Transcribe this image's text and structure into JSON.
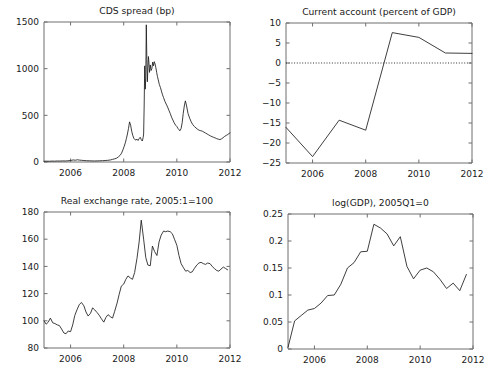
{
  "figure": {
    "name": "four-panel-macro-figure",
    "background": "#ffffff",
    "line_color": "#1c1c1c",
    "axis_color": "#6f6f6f",
    "panel_count": 4
  },
  "chart_data": [
    {
      "id": "cds",
      "type": "line",
      "title": "CDS spread (bp)",
      "xlabel": "",
      "ylabel": "",
      "grid": false,
      "legend": "none",
      "xlim": [
        2005.0,
        2012.0
      ],
      "ylim": [
        0,
        1500
      ],
      "xticks": [
        2006,
        2008,
        2010,
        2012
      ],
      "xticklabels": [
        "2006",
        "2008",
        "2010",
        "2012"
      ],
      "yticks": [
        0,
        500,
        1000,
        1500
      ],
      "yticklabels": [
        "0",
        "500",
        "1000",
        "1500"
      ],
      "series": [
        {
          "name": "CDS spread",
          "x": [
            2005.0,
            2005.1,
            2005.2,
            2005.3,
            2005.4,
            2005.5,
            2005.6,
            2005.7,
            2005.8,
            2005.9,
            2006.0,
            2006.1,
            2006.18,
            2006.26,
            2006.34,
            2006.42,
            2006.5,
            2006.6,
            2006.7,
            2006.8,
            2006.9,
            2007.0,
            2007.1,
            2007.2,
            2007.3,
            2007.4,
            2007.5,
            2007.58,
            2007.66,
            2007.74,
            2007.8,
            2007.86,
            2007.92,
            2007.97,
            2008.02,
            2008.06,
            2008.1,
            2008.14,
            2008.18,
            2008.22,
            2008.26,
            2008.3,
            2008.34,
            2008.38,
            2008.42,
            2008.46,
            2008.5,
            2008.54,
            2008.58,
            2008.62,
            2008.66,
            2008.7,
            2008.73,
            2008.75,
            2008.77,
            2008.79,
            2008.81,
            2008.83,
            2008.85,
            2008.87,
            2008.89,
            2008.91,
            2008.93,
            2008.95,
            2008.97,
            2009.0,
            2009.03,
            2009.06,
            2009.09,
            2009.12,
            2009.15,
            2009.18,
            2009.21,
            2009.24,
            2009.27,
            2009.3,
            2009.34,
            2009.38,
            2009.42,
            2009.46,
            2009.5,
            2009.55,
            2009.6,
            2009.65,
            2009.7,
            2009.75,
            2009.8,
            2009.85,
            2009.9,
            2009.95,
            2010.0,
            2010.04,
            2010.08,
            2010.12,
            2010.16,
            2010.2,
            2010.24,
            2010.28,
            2010.32,
            2010.36,
            2010.42,
            2010.48,
            2010.54,
            2010.6,
            2010.66,
            2010.72,
            2010.78,
            2010.84,
            2010.9,
            2010.96,
            2011.02,
            2011.08,
            2011.14,
            2011.2,
            2011.26,
            2011.32,
            2011.38,
            2011.44,
            2011.5,
            2011.56,
            2011.62,
            2011.68,
            2011.74,
            2011.8,
            2011.86,
            2011.92,
            2011.96,
            2012.0
          ],
          "y": [
            8,
            9,
            8,
            10,
            9,
            11,
            10,
            12,
            11,
            13,
            16,
            22,
            19,
            24,
            20,
            18,
            16,
            14,
            13,
            12,
            11,
            12,
            13,
            14,
            16,
            18,
            22,
            28,
            34,
            42,
            55,
            70,
            95,
            130,
            170,
            205,
            250,
            300,
            360,
            430,
            395,
            330,
            285,
            255,
            240,
            235,
            245,
            230,
            250,
            265,
            240,
            225,
            260,
            300,
            600,
            1030,
            780,
            900,
            1470,
            1100,
            860,
            1010,
            1130,
            1060,
            960,
            1040,
            980,
            1000,
            1070,
            1030,
            1075,
            1050,
            1010,
            960,
            915,
            880,
            830,
            800,
            760,
            720,
            690,
            650,
            620,
            590,
            555,
            520,
            480,
            450,
            420,
            395,
            380,
            360,
            345,
            335,
            360,
            420,
            520,
            600,
            655,
            610,
            520,
            470,
            430,
            400,
            380,
            365,
            350,
            340,
            335,
            330,
            320,
            310,
            300,
            290,
            280,
            272,
            265,
            258,
            250,
            245,
            240,
            248,
            260,
            275,
            285,
            295,
            305,
            312
          ]
        }
      ]
    },
    {
      "id": "current-account",
      "type": "line",
      "title": "Current account (percent of GDP)",
      "xlabel": "",
      "ylabel": "",
      "grid": false,
      "legend": "none",
      "xlim": [
        2005.0,
        2012.0
      ],
      "ylim": [
        -25,
        10
      ],
      "xticks": [
        2006,
        2008,
        2010,
        2012
      ],
      "xticklabels": [
        "2006",
        "2008",
        "2010",
        "2012"
      ],
      "yticks": [
        -25,
        -20,
        -15,
        -10,
        -5,
        0,
        5,
        10
      ],
      "yticklabels": [
        "−25",
        "−20",
        "−15",
        "−10",
        "−5",
        "0",
        "5",
        "10"
      ],
      "zero_line": {
        "value": 0,
        "style": "dotted"
      },
      "series": [
        {
          "name": "Current account",
          "x": [
            2005,
            2006,
            2007,
            2008,
            2009,
            2010,
            2011,
            2012
          ],
          "y": [
            -16.1,
            -23.4,
            -14.3,
            -16.8,
            7.6,
            6.4,
            2.5,
            2.4
          ]
        }
      ]
    },
    {
      "id": "real-exchange-rate",
      "type": "line",
      "title": "Real exchange rate, 2005:1=100",
      "xlabel": "",
      "ylabel": "",
      "grid": false,
      "legend": "none",
      "xlim": [
        2005.0,
        2012.0
      ],
      "ylim": [
        80,
        180
      ],
      "xticks": [
        2006,
        2008,
        2010,
        2012
      ],
      "xticklabels": [
        "2006",
        "2008",
        "2010",
        "2012"
      ],
      "yticks": [
        80,
        100,
        120,
        140,
        160,
        180
      ],
      "yticklabels": [
        "80",
        "100",
        "120",
        "140",
        "160",
        "180"
      ],
      "series": [
        {
          "name": "Real exchange rate",
          "x": [
            2005.0,
            2005.08,
            2005.16,
            2005.24,
            2005.33,
            2005.41,
            2005.5,
            2005.58,
            2005.66,
            2005.75,
            2005.83,
            2005.91,
            2006.0,
            2006.08,
            2006.16,
            2006.25,
            2006.33,
            2006.41,
            2006.5,
            2006.58,
            2006.66,
            2006.75,
            2006.83,
            2006.91,
            2007.0,
            2007.08,
            2007.16,
            2007.25,
            2007.33,
            2007.41,
            2007.5,
            2007.58,
            2007.66,
            2007.75,
            2007.83,
            2007.91,
            2008.0,
            2008.08,
            2008.16,
            2008.25,
            2008.33,
            2008.41,
            2008.5,
            2008.58,
            2008.66,
            2008.75,
            2008.83,
            2008.91,
            2009.0,
            2009.08,
            2009.16,
            2009.25,
            2009.33,
            2009.41,
            2009.5,
            2009.58,
            2009.66,
            2009.75,
            2009.83,
            2009.91,
            2010.0,
            2010.08,
            2010.16,
            2010.25,
            2010.33,
            2010.41,
            2010.5,
            2010.58,
            2010.66,
            2010.75,
            2010.83,
            2010.91,
            2011.0,
            2011.08,
            2011.16,
            2011.25,
            2011.33,
            2011.41,
            2011.5,
            2011.58,
            2011.66,
            2011.75,
            2011.83,
            2011.91
          ],
          "y": [
            100.0,
            97.5,
            99.0,
            102.0,
            98.5,
            98.0,
            97.0,
            96.5,
            94.0,
            91.0,
            90.5,
            92.5,
            92.0,
            97.0,
            104.0,
            108.5,
            112.0,
            113.5,
            111.0,
            106.5,
            103.5,
            105.5,
            109.5,
            108.0,
            106.0,
            104.0,
            101.5,
            99.0,
            102.5,
            104.5,
            103.0,
            102.0,
            107.0,
            113.0,
            119.5,
            125.5,
            127.0,
            130.5,
            133.0,
            131.5,
            130.5,
            135.5,
            146.0,
            158.0,
            174.0,
            160.0,
            146.5,
            141.0,
            140.5,
            155.0,
            151.0,
            148.0,
            158.0,
            163.0,
            166.0,
            165.5,
            166.0,
            165.5,
            164.0,
            160.0,
            155.5,
            148.0,
            142.0,
            139.0,
            136.5,
            137.0,
            135.5,
            136.0,
            138.5,
            141.0,
            142.5,
            143.0,
            142.0,
            141.5,
            142.5,
            142.0,
            140.0,
            138.5,
            137.0,
            136.5,
            138.0,
            139.5,
            138.5,
            137.5
          ]
        }
      ]
    },
    {
      "id": "log-gdp",
      "type": "line",
      "title": "log(GDP), 2005Q1=0",
      "xlabel": "",
      "ylabel": "",
      "grid": false,
      "legend": "none",
      "xlim": [
        2005.0,
        2012.0
      ],
      "ylim": [
        0,
        0.25
      ],
      "xticks": [
        2006,
        2008,
        2010,
        2012
      ],
      "xticklabels": [
        "2006",
        "2008",
        "2010",
        "2012"
      ],
      "yticks": [
        0,
        0.05,
        0.1,
        0.15,
        0.2,
        0.25
      ],
      "yticklabels": [
        "0",
        "0.05",
        "0.1",
        "0.15",
        "0.2",
        "0.25"
      ],
      "series": [
        {
          "name": "log GDP",
          "x": [
            2005.0,
            2005.25,
            2005.5,
            2005.75,
            2006.0,
            2006.25,
            2006.5,
            2006.75,
            2007.0,
            2007.25,
            2007.5,
            2007.75,
            2008.0,
            2008.25,
            2008.5,
            2008.75,
            2009.0,
            2009.25,
            2009.5,
            2009.75,
            2010.0,
            2010.25,
            2010.5,
            2010.75,
            2011.0,
            2011.25,
            2011.5,
            2011.75
          ],
          "y": [
            0.003,
            0.052,
            0.062,
            0.072,
            0.075,
            0.085,
            0.099,
            0.1,
            0.12,
            0.15,
            0.16,
            0.18,
            0.181,
            0.231,
            0.224,
            0.213,
            0.191,
            0.208,
            0.153,
            0.13,
            0.146,
            0.15,
            0.143,
            0.129,
            0.112,
            0.122,
            0.108,
            0.138
          ]
        }
      ]
    }
  ]
}
